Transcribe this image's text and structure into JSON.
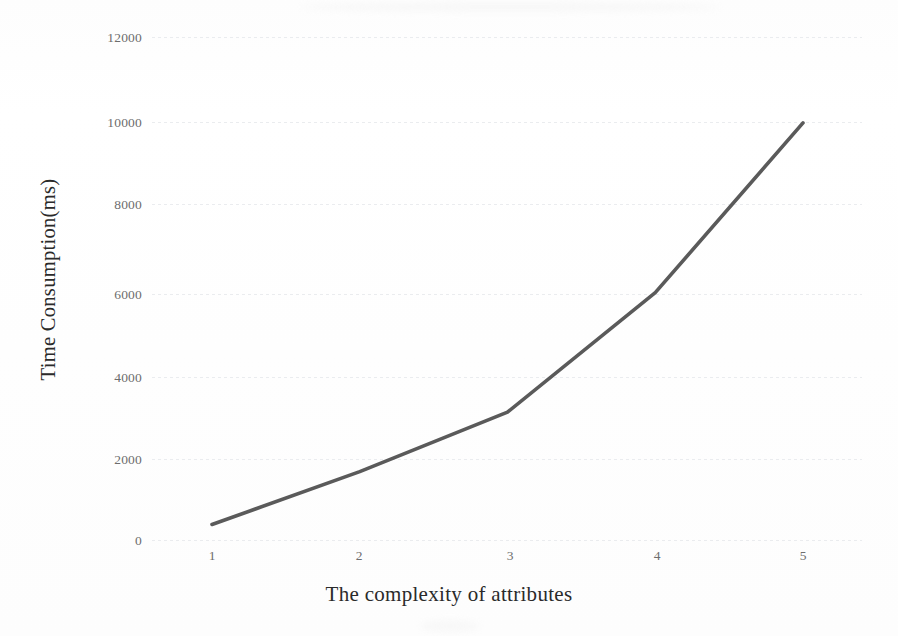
{
  "chart_data": {
    "type": "line",
    "title": "",
    "xlabel": "The complexity of attributes",
    "ylabel": "Time Consumption(ms)",
    "x": [
      1,
      2,
      3,
      4,
      5
    ],
    "categories": [
      "1",
      "2",
      "3",
      "4",
      "5"
    ],
    "values": [
      370,
      1630,
      3050,
      5900,
      9950
    ],
    "series": [
      {
        "name": "Time Consumption",
        "values": [
          370,
          1630,
          3050,
          5900,
          9950
        ],
        "color": "#5a5a5a"
      }
    ],
    "xlim": [
      0.6,
      5.45
    ],
    "ylim": [
      0,
      12000
    ],
    "ytick_labels": [
      "12000",
      "10000",
      "8000",
      "6000",
      "4000",
      "2000",
      "0"
    ],
    "ytick_values": [
      12000,
      10000,
      8000,
      6000,
      4000,
      2000,
      0
    ],
    "xtick_labels": [
      "1",
      "2",
      "3",
      "4",
      "5"
    ],
    "grid": "horizontal-dotted",
    "legend": "none",
    "markers": "none"
  },
  "axes": {
    "y_title": "Time Consumption(ms)",
    "x_title": "The complexity of attributes"
  },
  "colors": {
    "line": "#5a5a5a",
    "grid": "#e9ebee",
    "tick_text": "#6d6d6d",
    "title_text": "#2a2a2a",
    "background": "#fefefe"
  }
}
